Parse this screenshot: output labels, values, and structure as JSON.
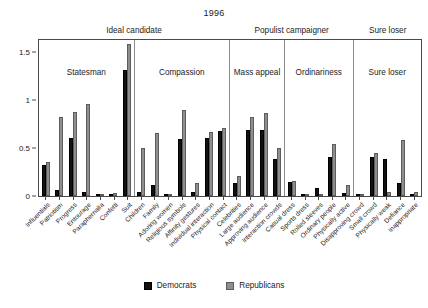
{
  "chart_data": {
    "type": "bar",
    "title": "1996",
    "xlabel": "",
    "ylabel": "",
    "ylim": [
      0,
      1.62
    ],
    "yticks": [
      0,
      0.5,
      1,
      1.5
    ],
    "ytick_labels": [
      "0",
      "0.5",
      "1",
      "1.5"
    ],
    "grid": false,
    "legend_position": "bottom-center",
    "series": [
      {
        "name": "Democrats",
        "color": "#111111"
      },
      {
        "name": "Republicans",
        "color": "#8e8e8e"
      }
    ],
    "supergroups": [
      {
        "label": "Ideal candidate",
        "panels": 2
      },
      {
        "label": "Populist campaigner",
        "panels": 2
      },
      {
        "label": "Sure loser",
        "panels": 1
      }
    ],
    "panels": [
      {
        "label": "Statesman",
        "categories": [
          {
            "label": "Influentials",
            "democrats": 0.32,
            "republicans": 0.35
          },
          {
            "label": "Patriotism",
            "democrats": 0.06,
            "republicans": 0.82
          },
          {
            "label": "Progress",
            "democrats": 0.6,
            "republicans": 0.87
          },
          {
            "label": "Entourage",
            "democrats": 0.04,
            "republicans": 0.96
          },
          {
            "label": "Paraphernalia",
            "democrats": 0.02,
            "republicans": 0.02
          },
          {
            "label": "Confetti",
            "democrats": 0.01,
            "republicans": 0.03
          },
          {
            "label": "Suit",
            "democrats": 1.31,
            "republicans": 1.58
          }
        ]
      },
      {
        "label": "Compassion",
        "categories": [
          {
            "label": "Children",
            "democrats": 0.04,
            "republicans": 0.5
          },
          {
            "label": "Family",
            "democrats": 0.11,
            "republicans": 0.65
          },
          {
            "label": "Adoring women",
            "democrats": 0.02,
            "republicans": 0.01
          },
          {
            "label": "Religious symbols",
            "democrats": 0.59,
            "republicans": 0.89
          },
          {
            "label": "Affinity gestures",
            "democrats": 0.04,
            "republicans": 0.13
          },
          {
            "label": "Individual interaction",
            "democrats": 0.6,
            "republicans": 0.66
          },
          {
            "label": "Physical contact",
            "democrats": 0.67,
            "republicans": 0.71
          }
        ]
      },
      {
        "label": "Mass appeal",
        "categories": [
          {
            "label": "Celebrities",
            "democrats": 0.14,
            "republicans": 0.21
          },
          {
            "label": "Large audience",
            "democrats": 0.69,
            "republicans": 0.82
          },
          {
            "label": "Approving audience",
            "democrats": 0.69,
            "republicans": 0.86
          },
          {
            "label": "Interaction crowds",
            "democrats": 0.38,
            "republicans": 0.5
          }
        ]
      },
      {
        "label": "Ordinariness",
        "categories": [
          {
            "label": "Casual dress",
            "democrats": 0.15,
            "republicans": 0.16
          },
          {
            "label": "Sports dress",
            "democrats": 0.01,
            "republicans": 0.01
          },
          {
            "label": "Rolled sleeves",
            "democrats": 0.08,
            "republicans": 0.02
          },
          {
            "label": "Ordinary people",
            "democrats": 0.4,
            "republicans": 0.54
          },
          {
            "label": "Physically active",
            "democrats": 0.03,
            "republicans": 0.11
          }
        ]
      },
      {
        "label": "Sure loser",
        "categories": [
          {
            "label": "Disapproving crowd",
            "democrats": 0.01,
            "republicans": 0.02
          },
          {
            "label": "Small crowd",
            "democrats": 0.4,
            "republicans": 0.45
          },
          {
            "label": "Physically weak",
            "democrats": 0.38,
            "republicans": 0.04
          },
          {
            "label": "Defiance",
            "democrats": 0.14,
            "republicans": 0.58
          },
          {
            "label": "Inappropriate",
            "democrats": 0.02,
            "republicans": 0.04
          }
        ]
      }
    ]
  },
  "legend": {
    "items": [
      {
        "label": "Democrats"
      },
      {
        "label": "Republicans"
      }
    ]
  }
}
